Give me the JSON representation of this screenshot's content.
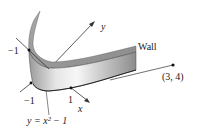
{
  "figure": {
    "wall_label": "Wall",
    "point_label": "(3, 4)",
    "curve_label": "y = x² − 1",
    "axis_x_label": "x",
    "axis_y_label": "y",
    "tick_neg1_y": "−1",
    "tick_neg1_x": "−1",
    "tick_1_x": "1"
  },
  "colors": {
    "surface_light": "#f2f2f2",
    "surface_mid": "#bdbdbd",
    "surface_dark": "#8a8a8a",
    "line": "#333333"
  }
}
